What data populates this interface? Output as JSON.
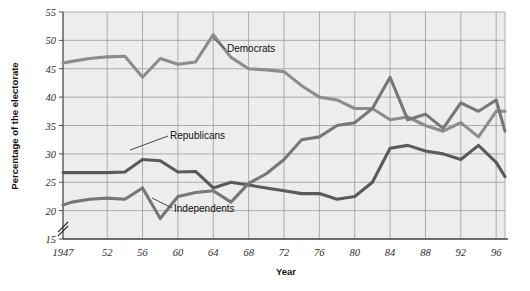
{
  "chart_data": {
    "type": "line",
    "title": "",
    "xlabel": "Year",
    "ylabel": "Percentage of the electorate",
    "xlim": [
      1947,
      1997
    ],
    "ylim": [
      15,
      55
    ],
    "grid": true,
    "axis_break": true,
    "legend_position": "inline-annotations",
    "x_tick_labels": [
      "1947",
      "52",
      "56",
      "60",
      "64",
      "68",
      "72",
      "76",
      "80",
      "84",
      "88",
      "92",
      "96"
    ],
    "x_tick_values": [
      1947,
      1952,
      1956,
      1960,
      1964,
      1968,
      1972,
      1976,
      1980,
      1984,
      1988,
      1992,
      1996
    ],
    "y_tick_labels": [
      "15",
      "20",
      "25",
      "30",
      "35",
      "40",
      "45",
      "50",
      "55"
    ],
    "y_tick_values": [
      15,
      20,
      25,
      30,
      35,
      40,
      45,
      50,
      55
    ],
    "x": [
      1947,
      1948,
      1950,
      1952,
      1954,
      1956,
      1958,
      1960,
      1962,
      1964,
      1966,
      1968,
      1970,
      1972,
      1974,
      1976,
      1978,
      1980,
      1982,
      1984,
      1986,
      1988,
      1990,
      1992,
      1994,
      1996,
      1997
    ],
    "series": [
      {
        "name": "Democrats",
        "color": "#8c8c8c",
        "values": [
          46.0,
          46.3,
          46.8,
          47.1,
          47.2,
          43.5,
          46.8,
          45.8,
          46.2,
          51.0,
          47.0,
          45.0,
          44.8,
          44.5,
          42.0,
          40.0,
          39.5,
          38.0,
          38.0,
          36.0,
          36.5,
          35.0,
          34.0,
          35.5,
          33.0,
          37.5,
          37.5
        ]
      },
      {
        "name": "Republicans",
        "color": "#5a5a5a",
        "values": [
          26.7,
          26.7,
          26.7,
          26.7,
          26.8,
          29.0,
          28.8,
          26.8,
          26.9,
          24.0,
          25.0,
          24.5,
          24.0,
          23.5,
          23.0,
          23.0,
          22.0,
          22.5,
          25.0,
          31.0,
          31.5,
          30.5,
          30.0,
          29.0,
          31.5,
          28.5,
          26.0
        ]
      },
      {
        "name": "Independents",
        "color": "#777777",
        "values": [
          21.0,
          21.5,
          22.0,
          22.2,
          22.0,
          24.0,
          18.6,
          22.5,
          23.2,
          23.5,
          21.5,
          24.8,
          26.5,
          29.0,
          32.5,
          33.0,
          35.0,
          35.5,
          38.0,
          43.5,
          36.0,
          37.0,
          34.5,
          39.0,
          37.5,
          39.5,
          34.0
        ]
      }
    ],
    "annotations": [
      {
        "label": "Democrats",
        "x": 1966,
        "y": 48.5
      },
      {
        "label": "Republicans",
        "x": 1957,
        "y": 31.5
      },
      {
        "label": "Independents",
        "x": 1959,
        "y": 19.0
      }
    ]
  },
  "axis": {
    "y_title": "Percentage of the electorate",
    "x_title": "Year"
  },
  "colors": {
    "plot_background": "#ededed",
    "page_background": "#ffffff",
    "grid": "#9a9a9a",
    "axis": "#4a4a4a",
    "democrats": "#8c8c8c",
    "republicans": "#5a5a5a",
    "independents": "#777777",
    "text": "#111111"
  }
}
